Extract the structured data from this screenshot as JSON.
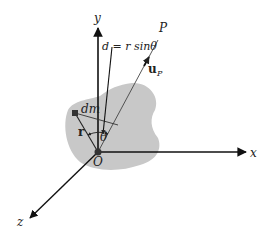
{
  "diagram": {
    "title": "",
    "colors": {
      "body_fill": "#c8c8c8",
      "axis": "#111111",
      "line": "#222222",
      "background": "#ffffff"
    },
    "axes": {
      "x_label": "x",
      "y_label": "y",
      "z_label": "z",
      "origin_label": "O"
    },
    "labels": {
      "point_P": "P",
      "unit_vector": "u",
      "unit_vector_subscript": "P",
      "mass_element": "dm",
      "position_vector": "r",
      "angle": "θ",
      "distance_equation": "d = r sinθ"
    }
  }
}
